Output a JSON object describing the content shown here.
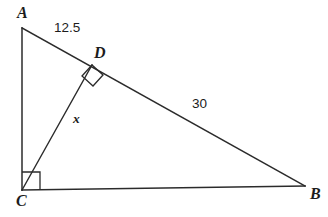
{
  "figure": {
    "type": "geometry-diagram",
    "background_color": "#ffffff",
    "stroke_color": "#2b2b2b",
    "text_color": "#1c1c1c",
    "vertices": {
      "A": {
        "label": "A",
        "x": 22,
        "y": 28
      },
      "B": {
        "label": "B",
        "x": 305,
        "y": 186
      },
      "C": {
        "label": "C",
        "x": 22,
        "y": 190
      },
      "D": {
        "label": "D",
        "x": 92,
        "y": 65
      }
    },
    "segments": [
      {
        "name": "leg-ac",
        "from": "A",
        "to": "C",
        "label": ""
      },
      {
        "name": "leg-cb",
        "from": "C",
        "to": "B",
        "label": ""
      },
      {
        "name": "hypotenuse-ab",
        "from": "A",
        "to": "B",
        "label": ""
      },
      {
        "name": "altitude-cd",
        "from": "C",
        "to": "D",
        "label": "x"
      }
    ],
    "measures": {
      "segment_ad": "12.5",
      "segment_db": "30",
      "altitude_cd": "x"
    },
    "right_angles": [
      {
        "name": "right-angle-at-c",
        "at": "C",
        "orientation": "axis-aligned"
      },
      {
        "name": "right-angle-at-d",
        "at": "D",
        "orientation": "rotated"
      }
    ]
  }
}
